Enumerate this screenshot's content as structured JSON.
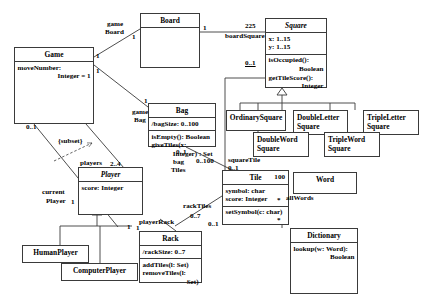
{
  "diagram": {
    "type": "uml-class-diagram",
    "stroke_color": "#3a3a3a",
    "background": "#ffffff"
  },
  "classes": {
    "game": {
      "name": "Game",
      "abstract": false,
      "attributes": [
        "moveNumber:",
        "Integer = 1"
      ],
      "operations": []
    },
    "board": {
      "name": "Board",
      "abstract": false,
      "attributes": [],
      "operations": []
    },
    "square": {
      "name": "Square",
      "abstract": true,
      "attributes": [
        "x: 1..15",
        "y: 1..15"
      ],
      "operations": [
        "isOccupied():",
        "Boolean",
        "getTileScore():",
        "Integer"
      ]
    },
    "bag": {
      "name": "Bag",
      "abstract": false,
      "attributes": [
        "/bagSize: 0..100"
      ],
      "operations": [
        "isEmpty(): Boolean",
        "giveTiles(x:",
        "Integer) : Set"
      ]
    },
    "tile": {
      "name": "Tile",
      "abstract": false,
      "corner_mult": "100",
      "attributes": [
        "symbol: char",
        "score: Integer"
      ],
      "operations": [
        "setSymbol(c: char)"
      ]
    },
    "player": {
      "name": "Player",
      "abstract": true,
      "attributes": [
        "score: Integer"
      ],
      "operations": []
    },
    "human_player": {
      "name": "HumanPlayer",
      "abstract": false,
      "attributes": [],
      "operations": []
    },
    "computer_player": {
      "name": "ComputerPlayer",
      "abstract": false,
      "attributes": [],
      "operations": []
    },
    "rack": {
      "name": "Rack",
      "abstract": false,
      "attributes": [
        "/rackSize: 0..7"
      ],
      "operations": [
        "addTiles(l: Set)",
        "removeTiles(l:",
        "Set)"
      ]
    },
    "ordinary_square": {
      "name": "OrdinarySquare",
      "abstract": false
    },
    "double_letter_square": {
      "name": "DoubleLetter\nSquare",
      "line1": "DoubleLetter",
      "line2": "Square",
      "abstract": false
    },
    "triple_letter_square": {
      "name": "TripleLetter\nSquare",
      "line1": "TripleLetter",
      "line2": "Square",
      "abstract": false
    },
    "double_word_square": {
      "name": "DoubleWord\nSquare",
      "line1": "DoubleWord",
      "line2": "Square",
      "abstract": false
    },
    "triple_word_square": {
      "name": "TripleWord\nSquare",
      "line1": "TripleWord",
      "line2": "Square",
      "abstract": false
    },
    "word": {
      "name": "Word",
      "abstract": false,
      "attributes": [],
      "operations": []
    },
    "dictionary": {
      "name": "Dictionary",
      "abstract": false,
      "attributes": [],
      "operations": [
        "lookup(w: Word):",
        "Boolean"
      ]
    }
  },
  "association_labels": {
    "game_board_role": "game\nBoard",
    "game_board_role_l1": "game",
    "game_board_role_l2": "Board",
    "game_board_mult_game": "1",
    "game_board_mult_board": "1",
    "game_bag_role_l1": "game",
    "game_bag_role_l2": "Bag",
    "game_bag_mult_game": "1",
    "game_bag_mult_bag": "1",
    "board_square_role": "boardSquare",
    "board_square_mult_board": "1",
    "board_square_mult_square": "225",
    "square_tile_role": "squareTile",
    "square_tile_mult_square": "0..1",
    "square_tile_mult_tile": "0..1",
    "bag_tiles_role_l1": "bag",
    "bag_tiles_role_l2": "Tiles",
    "bag_tiles_mult_bag": "0..1",
    "bag_tiles_mult_tile": "0..100",
    "rack_tiles_role": "rackTiles",
    "rack_tiles_mult_rack": "0..7",
    "rack_tiles_mult_tile": "0..1",
    "player_rack_role": "playerRack",
    "player_rack_mult_player": "1",
    "player_rack_mult_rack": "1",
    "game_players_role": "players",
    "game_players_mult": "2..4",
    "game_current_player_role_l1": "current",
    "game_current_player_role_l2": "Player",
    "game_current_player_mult_game": "0..1",
    "game_current_player_mult_player": "1",
    "subset_constraint": "{subset}",
    "dictionary_word_role": "allWords",
    "dictionary_word_mult_word": "*",
    "dictionary_word_mult_dict": "*"
  }
}
